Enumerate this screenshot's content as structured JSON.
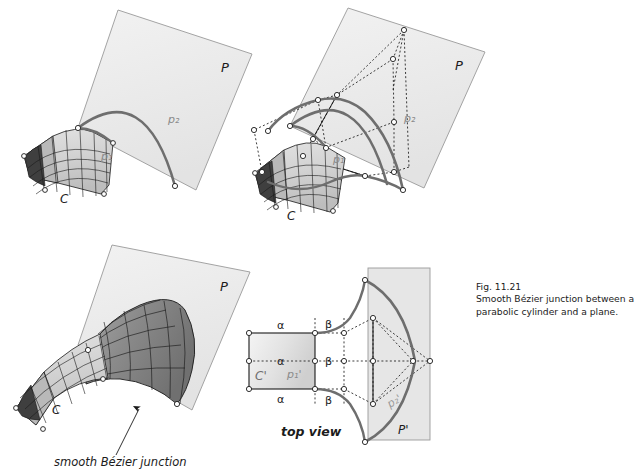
{
  "figure": {
    "number": "Fig. 11.21",
    "caption_line1": "Smooth Bézier junction between a",
    "caption_line2": "parabolic cylinder and a plane."
  },
  "colors": {
    "background": "#ffffff",
    "plane_fill": "#ededed",
    "plane_stroke": "#8a8a8a",
    "curve": "#6e6e6e",
    "mesh_line": "#1a1a1a",
    "cylinder_light": "#d8d8d8",
    "cylinder_mid": "#c2c2c2",
    "junction_dark": "#8f8f8f",
    "junction_darker": "#6b6b6b",
    "cap_dark": "#3a3a3a",
    "dotted": "#1a1a1a",
    "label": "#8a8a8a",
    "text": "#1b1b1b"
  },
  "panels": {
    "top_left": {
      "name": "parabolic cylinder and plane",
      "plane_label": "P",
      "curve_plane_label": "p₂",
      "curve_cylinder_label": "p₁",
      "cylinder_label": "C"
    },
    "top_right": {
      "name": "Bezier control net construction",
      "plane_label": "P",
      "curve_plane_label": "p₂",
      "curve_cylinder_label": "p₁",
      "cylinder_label": "C"
    },
    "bottom_left": {
      "name": "resulting smooth junction surface",
      "plane_label": "P",
      "cylinder_label": "C",
      "annotation": "smooth Bézier junction"
    },
    "top_view": {
      "name": "top view of the junction",
      "title": "top view",
      "rect_label": "C'",
      "curve_cylinder_label": "p₁'",
      "curve_plane_label": "p₂'",
      "plane_label": "P'",
      "alpha_top": "α",
      "alpha_mid": "α",
      "alpha_bottom": "α",
      "beta_top": "β",
      "beta_mid": "β",
      "beta_bottom": "β"
    }
  }
}
